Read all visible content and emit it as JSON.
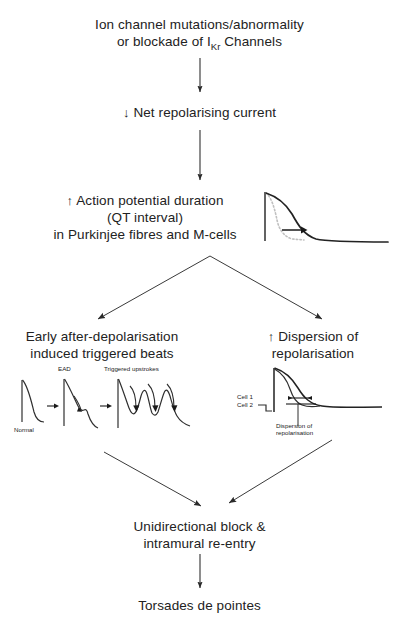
{
  "figure": {
    "type": "flowchart",
    "orientation": "top-to-bottom"
  },
  "nodes": {
    "trigger": {
      "line1": "Ion channel mutations/abnormality",
      "line2_pre": "or blockade of I",
      "line2_sub": "Kr",
      "line2_post": " Channels"
    },
    "net_current": {
      "arrow": "↓",
      "text": "Net repolarising current"
    },
    "apd": {
      "arrow": "↑",
      "line1": "Action potential duration",
      "line2": "(QT interval)",
      "line3": "in Purkinjee fibres and M-cells"
    },
    "ead": {
      "line1": "Early after-depolarisation",
      "line2": "induced triggered beats"
    },
    "dispersion": {
      "arrow": "↑",
      "line1": "Dispersion of",
      "line2": "repolarisation"
    },
    "block": {
      "line1": "Unidirectional block &",
      "line2": "intramural re-entry"
    },
    "outcome": {
      "text": "Torsades de pointes"
    }
  },
  "insets": {
    "action_potential": {
      "name": "action-potential-prolongation-trace",
      "description": "Action potential trace: dotted normal repolarisation, solid prolonged repolarisation, horizontal arrow showing prolongation"
    },
    "ead_sequence": {
      "name": "ead-triggered-beats-trace",
      "labels": {
        "normal": "Normal",
        "ead": "EAD",
        "triggered": "Triggered upstrokes"
      }
    },
    "dispersion_trace": {
      "name": "dispersion-of-repolarisation-trace",
      "labels": {
        "cell1": "Cell 1",
        "cell2": "Cell 2",
        "annotation_line1": "Dispersion of",
        "annotation_line2": "repolarisation"
      }
    }
  },
  "colors": {
    "ink": "#222222",
    "line": "#3a3a3a",
    "dotted": "#b8b8b8",
    "background": "#ffffff"
  }
}
